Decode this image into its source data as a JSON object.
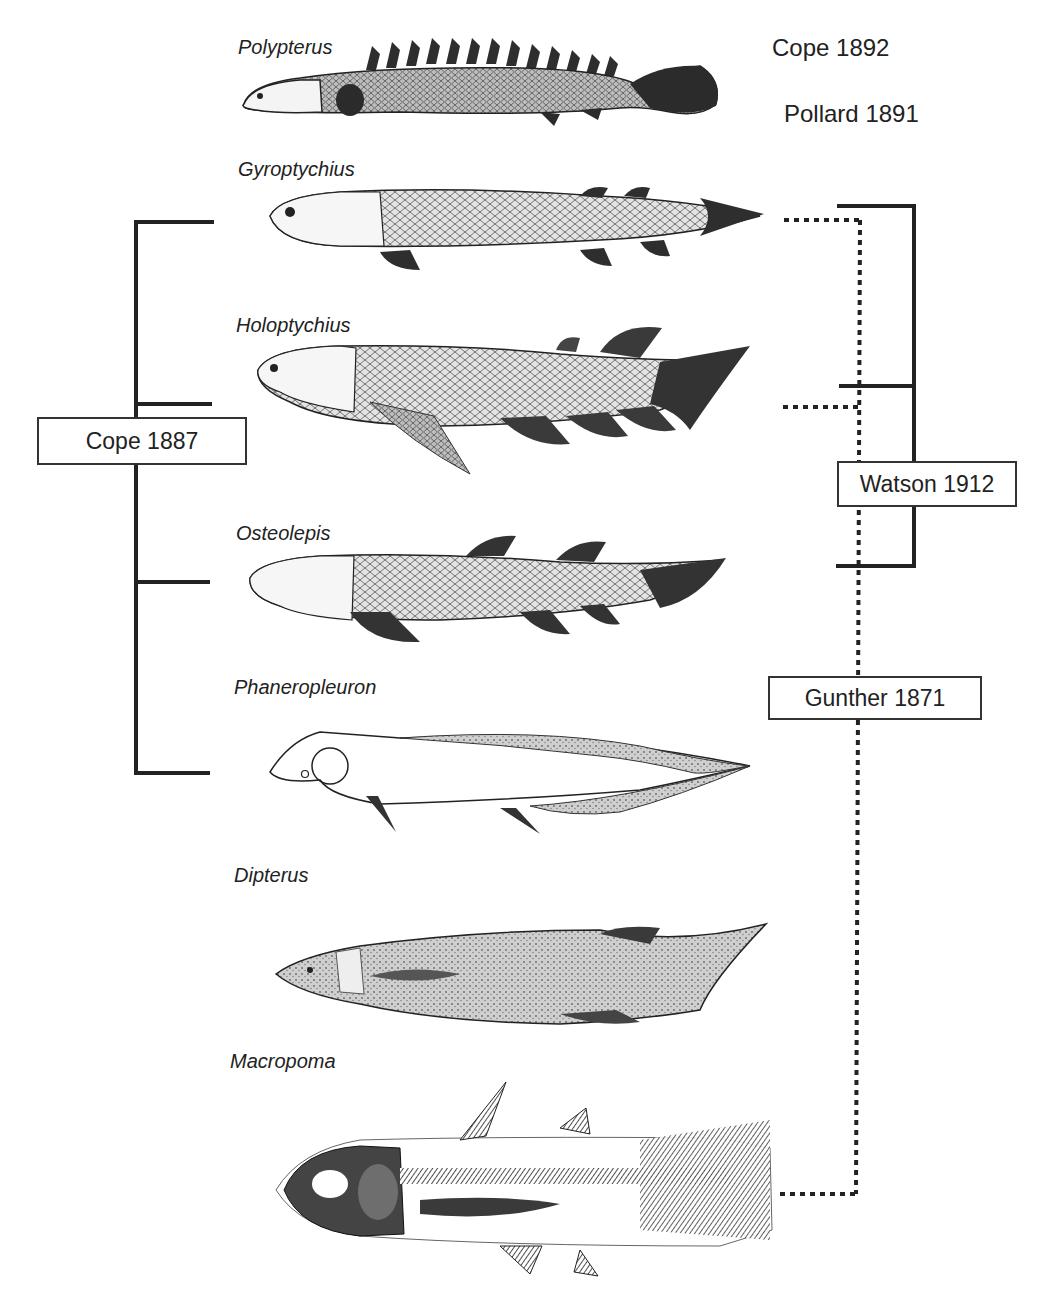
{
  "species": [
    {
      "name": "Polypterus"
    },
    {
      "name": "Gyroptychius"
    },
    {
      "name": "Holoptychius"
    },
    {
      "name": "Osteolepis"
    },
    {
      "name": "Phaneropleuron"
    },
    {
      "name": "Dipterus"
    },
    {
      "name": "Macropoma"
    }
  ],
  "references": {
    "cope_1892": "Cope 1892",
    "pollard_1891": "Pollard 1891",
    "cope_1887": "Cope 1887",
    "watson_1912": "Watson 1912",
    "gunther_1871": "Gunther 1871"
  },
  "groupings": {
    "cope_1887": {
      "style": "solid",
      "side": "left",
      "members": [
        "Gyroptychius",
        "Holoptychius",
        "Osteolepis",
        "Phaneropleuron"
      ]
    },
    "watson_1912": {
      "style": "solid",
      "side": "right",
      "members": [
        "Gyroptychius",
        "Holoptychius",
        "Osteolepis"
      ]
    },
    "gunther_1871": {
      "style": "dotted",
      "side": "right",
      "members": [
        "Gyroptychius",
        "Holoptychius",
        "Macropoma"
      ]
    }
  },
  "colors": {
    "line": "#222222",
    "fish_dark": "#3a3a3a",
    "fish_mid": "#8a8a8a",
    "fish_light": "#d8d8d8"
  }
}
